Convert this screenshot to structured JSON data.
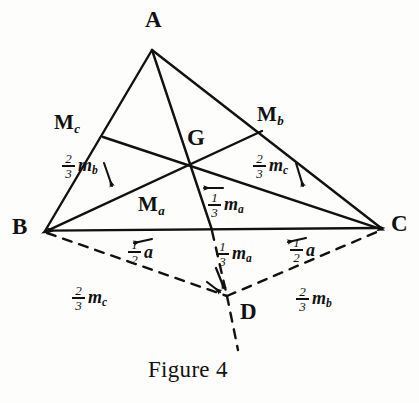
{
  "figure": {
    "caption": "Figure 4",
    "stroke_color": "#111111",
    "background_color": "#fdfdfb",
    "points": [
      {
        "id": "A",
        "label": "A",
        "sub": "",
        "x": 152,
        "y": 50,
        "label_x": 145,
        "label_y": 8
      },
      {
        "id": "B",
        "label": "B",
        "sub": "",
        "x": 45,
        "y": 231,
        "label_x": 12,
        "label_y": 215
      },
      {
        "id": "C",
        "label": "C",
        "sub": "",
        "x": 381,
        "y": 228,
        "label_x": 391,
        "label_y": 212
      },
      {
        "id": "G",
        "label": "G",
        "sub": "",
        "x": 190,
        "y": 172,
        "label_x": 187,
        "label_y": 126
      },
      {
        "id": "Mc",
        "label": "M",
        "sub": "c",
        "x": 103,
        "y": 137,
        "label_x": 54,
        "label_y": 112
      },
      {
        "id": "Mb",
        "label": "M",
        "sub": "b",
        "x": 262,
        "y": 131,
        "label_x": 257,
        "label_y": 104
      },
      {
        "id": "Ma",
        "label": "M",
        "sub": "a",
        "x": 212,
        "y": 230,
        "label_x": 138,
        "label_y": 194
      },
      {
        "id": "D",
        "label": "D",
        "sub": "",
        "x": 227,
        "y": 296,
        "label_x": 240,
        "label_y": 300
      }
    ],
    "annotations": [
      {
        "id": "two-thirds-mb-upper",
        "num": "2",
        "den": "3",
        "sym": "m",
        "sym_sub": "b",
        "x": 62,
        "y": 152
      },
      {
        "id": "two-thirds-mc-upper",
        "num": "2",
        "den": "3",
        "sym": "m",
        "sym_sub": "c",
        "x": 253,
        "y": 152
      },
      {
        "id": "one-third-ma-upper",
        "num": "1",
        "den": "3",
        "sym": "m",
        "sym_sub": "a",
        "x": 208,
        "y": 191
      },
      {
        "id": "one-half-a-left",
        "num": "1",
        "den": "2",
        "sym": "a",
        "sym_sub": "",
        "x": 128,
        "y": 238
      },
      {
        "id": "one-third-ma-lower",
        "num": "1",
        "den": "3",
        "sym": "m",
        "sym_sub": "a",
        "x": 216,
        "y": 240
      },
      {
        "id": "one-half-a-right",
        "num": "1",
        "den": "2",
        "sym": "a",
        "sym_sub": "",
        "x": 290,
        "y": 236
      },
      {
        "id": "two-thirds-mc-lower",
        "num": "2",
        "den": "3",
        "sym": "m",
        "sym_sub": "c",
        "x": 72,
        "y": 284
      },
      {
        "id": "two-thirds-mb-lower",
        "num": "2",
        "den": "3",
        "sym": "m",
        "sym_sub": "b",
        "x": 296,
        "y": 285
      }
    ],
    "caption_pos": {
      "x": 148,
      "y": 357
    }
  }
}
